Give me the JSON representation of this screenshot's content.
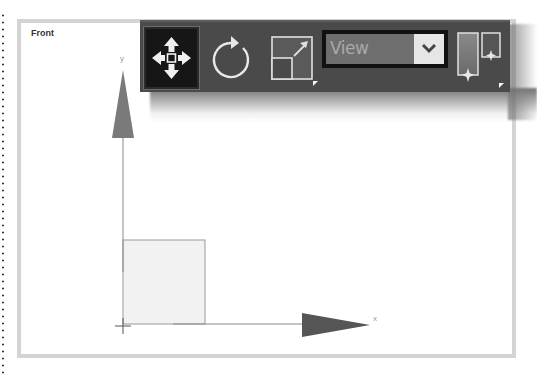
{
  "viewport": {
    "label": "Front",
    "axes": {
      "y_label": "y",
      "x_label": "x"
    },
    "colors": {
      "frame_border": "#d4d4d4",
      "axis_arrow": "#7a7a7a",
      "x_arrow": "#555555",
      "object_fill": "#f2f2f2",
      "object_stroke": "#999999"
    }
  },
  "toolbar": {
    "tools": [
      {
        "name": "move",
        "icon": "move-arrows-icon",
        "selected": true
      },
      {
        "name": "rotate",
        "icon": "rotate-icon",
        "selected": false
      },
      {
        "name": "scale",
        "icon": "scale-icon",
        "selected": false
      },
      {
        "name": "layout",
        "icon": "layout-panels-icon",
        "selected": false
      }
    ],
    "view_dropdown": {
      "selected": "View",
      "icon": "chevron-down-icon"
    },
    "colors": {
      "background": "#4a4a4a",
      "selected_bg": "#161616",
      "icon": "#e8e8e8"
    }
  }
}
